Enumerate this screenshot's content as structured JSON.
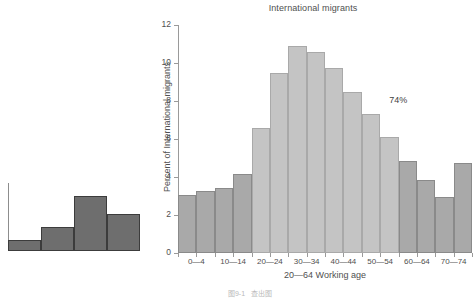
{
  "chart_data": {
    "type": "bar",
    "title": "International migrants",
    "xlabel": "20—64 Working age",
    "ylabel": "Percent of International migrants",
    "categories": [
      "0—4",
      "5—9",
      "10—14",
      "15—19",
      "20—24",
      "25—29",
      "30—34",
      "35—39",
      "40—44",
      "45—49",
      "50—54",
      "55—59",
      "60—64",
      "65—69",
      "70—74",
      "75—79"
    ],
    "values": [
      3.05,
      3.25,
      3.4,
      4.15,
      6.6,
      9.5,
      10.9,
      10.6,
      9.75,
      8.5,
      7.3,
      6.1,
      4.85,
      3.85,
      2.95,
      4.75
    ],
    "bar_groups": [
      "dark",
      "dark",
      "dark",
      "dark",
      "light",
      "light",
      "light",
      "light",
      "light",
      "light",
      "light",
      "light",
      "dark",
      "dark",
      "dark",
      "dark"
    ],
    "ylim": [
      0,
      12
    ],
    "yticks": [
      0,
      2,
      4,
      6,
      8,
      10,
      12
    ],
    "ytick_labels": [
      "0",
      "2",
      "4",
      "6",
      "8",
      "10",
      "12"
    ],
    "visible_xtick_labels": [
      "0—4",
      "10—14",
      "20—24",
      "30—34",
      "40—44",
      "50—54",
      "60—64",
      "70—74"
    ],
    "visible_xtick_indices": [
      0,
      2,
      4,
      6,
      8,
      10,
      12,
      14
    ],
    "annotations": [
      {
        "text": "74%",
        "x_index": 11,
        "y_value": 8.0
      }
    ],
    "grid": false,
    "legend": null,
    "colors": {
      "bar_dark": "#a9a9a9",
      "bar_light": "#c4c4c4",
      "axis": "#9a9a9a",
      "text": "#4f4f4f"
    }
  },
  "thumbnail_chart": {
    "type": "bar",
    "values": [
      1.0,
      2.2,
      5.0,
      3.3
    ],
    "ylim": [
      0,
      5.6
    ],
    "color": "#6e6e6e",
    "border_color": "#3c3c3c"
  },
  "caption": {
    "number": "图9-1",
    "text": "查出图"
  }
}
